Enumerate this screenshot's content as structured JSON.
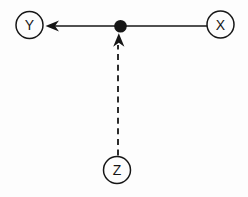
{
  "diagram": {
    "kind": "causal-graph",
    "background": "#fdfdfd",
    "stroke_color": "#161616",
    "canvas": {
      "width": 248,
      "height": 197
    },
    "nodes": [
      {
        "id": "Y",
        "label": "Y",
        "cx": 29.5,
        "cy": 25,
        "r": 13.5
      },
      {
        "id": "X",
        "label": "X",
        "cx": 220.5,
        "cy": 24.5,
        "r": 13.5
      },
      {
        "id": "Z",
        "label": "Z",
        "cx": 117,
        "cy": 170,
        "r": 13.5
      }
    ],
    "junction_dot": {
      "cx": 120.5,
      "cy": 26.2,
      "r": 6.3
    },
    "edges": [
      {
        "id": "x-to-y",
        "from": "X",
        "to": "Y",
        "style": "solid",
        "x1": 207,
        "y1": 26,
        "x2": 55,
        "y2": 26,
        "arrow_tip_x": 45.5,
        "arrow_tip_y": 26,
        "arrow_dir": "left"
      },
      {
        "id": "z-to-junction",
        "from": "Z",
        "to": "junction_dot",
        "style": "dashed",
        "x1": 118,
        "y1": 155.5,
        "x2": 118,
        "y2": 45,
        "arrow_tip_x": 118.8,
        "arrow_tip_y": 33.2,
        "arrow_dir": "up"
      }
    ]
  }
}
